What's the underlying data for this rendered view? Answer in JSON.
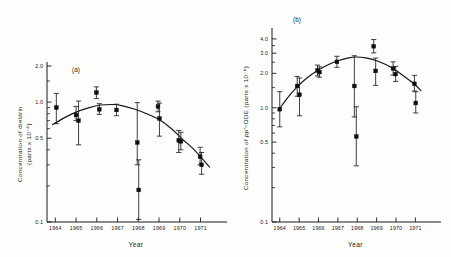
{
  "figure": {
    "background": "#fdfdfb",
    "ink": "#141414",
    "panels": [
      "a",
      "b"
    ]
  },
  "chart_data": [
    {
      "type": "scatter",
      "panel_label": "(a)",
      "title": "",
      "xlabel": "Year",
      "ylabel": "Concentration of dieldrin (parts x 10⁻⁶)",
      "ylabel_line1": "Concentration of dieldrin",
      "ylabel_line2": "(parts x 10⁻⁶)",
      "yscale": "log",
      "ylim": [
        0.1,
        2.0
      ],
      "ytick_labels": [
        "2.0",
        "1.0",
        "0.5",
        "0.1"
      ],
      "ytick_values": [
        2.0,
        1.0,
        0.5,
        0.1
      ],
      "yminor_values": [
        1.5,
        0.9,
        0.8,
        0.7,
        0.6,
        0.4,
        0.3,
        0.2
      ],
      "xlim": [
        1963.6,
        1971.6
      ],
      "xtick_labels": [
        "1964",
        "1965",
        "1966",
        "1967",
        "1968",
        "1969",
        "1970",
        "1971"
      ],
      "xtick_values": [
        1964,
        1965,
        1966,
        1967,
        1968,
        1969,
        1970,
        1971
      ],
      "grid": false,
      "legend": null,
      "marker": "filled-square",
      "points": [
        {
          "x": 1964.05,
          "y": 0.9,
          "ylo": 0.66,
          "yhi": 1.18
        },
        {
          "x": 1965.0,
          "y": 0.78,
          "ylo": 0.7,
          "yhi": 0.92
        },
        {
          "x": 1965.12,
          "y": 0.7,
          "ylo": 0.44,
          "yhi": 1.02
        },
        {
          "x": 1965.98,
          "y": 1.2,
          "ylo": 1.07,
          "yhi": 1.34
        },
        {
          "x": 1966.12,
          "y": 0.87,
          "ylo": 0.79,
          "yhi": 0.97
        },
        {
          "x": 1966.95,
          "y": 0.86,
          "ylo": 0.77,
          "yhi": 0.96
        },
        {
          "x": 1967.95,
          "y": 0.46,
          "ylo": 0.3,
          "yhi": 0.99
        },
        {
          "x": 1968.02,
          "y": 0.185,
          "ylo": 0.105,
          "yhi": 0.33
        },
        {
          "x": 1968.95,
          "y": 0.92,
          "ylo": 0.83,
          "yhi": 1.02
        },
        {
          "x": 1969.02,
          "y": 0.73,
          "ylo": 0.52,
          "yhi": 0.98
        },
        {
          "x": 1969.95,
          "y": 0.48,
          "ylo": 0.38,
          "yhi": 0.58
        },
        {
          "x": 1970.05,
          "y": 0.47,
          "ylo": 0.4,
          "yhi": 0.56
        },
        {
          "x": 1970.98,
          "y": 0.35,
          "ylo": 0.3,
          "yhi": 0.42
        },
        {
          "x": 1971.05,
          "y": 0.3,
          "ylo": 0.25,
          "yhi": 0.38
        }
      ],
      "fit_curve": [
        {
          "x": 1963.85,
          "y": 0.645
        },
        {
          "x": 1964.4,
          "y": 0.735
        },
        {
          "x": 1965.0,
          "y": 0.825
        },
        {
          "x": 1965.6,
          "y": 0.895
        },
        {
          "x": 1966.2,
          "y": 0.945
        },
        {
          "x": 1966.8,
          "y": 0.955
        },
        {
          "x": 1967.2,
          "y": 0.935
        },
        {
          "x": 1967.8,
          "y": 0.875
        },
        {
          "x": 1968.4,
          "y": 0.8
        },
        {
          "x": 1969.0,
          "y": 0.715
        },
        {
          "x": 1969.6,
          "y": 0.6
        },
        {
          "x": 1970.1,
          "y": 0.495
        },
        {
          "x": 1970.6,
          "y": 0.415
        },
        {
          "x": 1971.1,
          "y": 0.335
        },
        {
          "x": 1971.45,
          "y": 0.285
        }
      ]
    },
    {
      "type": "scatter",
      "panel_label": "(b)",
      "title": "",
      "xlabel": "Year",
      "ylabel": "Concentration of pp'-DDE (parts x 10⁻⁶)",
      "ylabel_pre": "Concentration of ",
      "ylabel_italic": "pp'",
      "ylabel_post": "−DDE (parts x 10⁻⁶)",
      "yscale": "log",
      "ylim": [
        0.1,
        4.6
      ],
      "ytick_labels": [
        "4.0",
        "3.0",
        "2.0",
        "1.0",
        "0.5",
        "0.1"
      ],
      "ytick_values": [
        4.0,
        3.0,
        2.0,
        1.0,
        0.5,
        0.1
      ],
      "yminor_values": [
        3.5,
        2.5,
        1.5,
        0.9,
        0.8,
        0.7,
        0.6,
        0.4,
        0.3,
        0.2
      ],
      "xlim": [
        1963.6,
        1971.6
      ],
      "xtick_labels": [
        "1964",
        "1965",
        "1966",
        "1967",
        "1968",
        "1969",
        "1970",
        "1971"
      ],
      "xtick_values": [
        1964,
        1965,
        1966,
        1967,
        1968,
        1969,
        1970,
        1971
      ],
      "grid": false,
      "legend": null,
      "marker": "filled-square",
      "points": [
        {
          "x": 1964.0,
          "y": 0.97,
          "ylo": 0.68,
          "yhi": 1.38
        },
        {
          "x": 1964.9,
          "y": 1.55,
          "ylo": 1.26,
          "yhi": 1.88
        },
        {
          "x": 1965.02,
          "y": 1.3,
          "ylo": 0.85,
          "yhi": 1.82
        },
        {
          "x": 1965.95,
          "y": 2.12,
          "ylo": 1.9,
          "yhi": 2.36
        },
        {
          "x": 1966.05,
          "y": 2.05,
          "ylo": 1.85,
          "yhi": 2.28
        },
        {
          "x": 1966.95,
          "y": 2.52,
          "ylo": 2.26,
          "yhi": 2.82
        },
        {
          "x": 1967.85,
          "y": 1.55,
          "ylo": 0.83,
          "yhi": 2.85
        },
        {
          "x": 1967.95,
          "y": 0.56,
          "ylo": 0.31,
          "yhi": 1.02
        },
        {
          "x": 1968.85,
          "y": 3.45,
          "ylo": 3.02,
          "yhi": 3.95
        },
        {
          "x": 1968.95,
          "y": 2.1,
          "ylo": 1.57,
          "yhi": 2.72
        },
        {
          "x": 1969.85,
          "y": 2.2,
          "ylo": 1.93,
          "yhi": 2.52
        },
        {
          "x": 1969.98,
          "y": 1.97,
          "ylo": 1.7,
          "yhi": 2.3
        },
        {
          "x": 1970.95,
          "y": 1.62,
          "ylo": 1.4,
          "yhi": 1.92
        },
        {
          "x": 1971.02,
          "y": 1.1,
          "ylo": 0.9,
          "yhi": 1.38
        }
      ],
      "fit_curve": [
        {
          "x": 1963.95,
          "y": 0.96
        },
        {
          "x": 1964.4,
          "y": 1.22
        },
        {
          "x": 1964.9,
          "y": 1.52
        },
        {
          "x": 1965.4,
          "y": 1.82
        },
        {
          "x": 1965.95,
          "y": 2.12
        },
        {
          "x": 1966.5,
          "y": 2.38
        },
        {
          "x": 1967.0,
          "y": 2.58
        },
        {
          "x": 1967.5,
          "y": 2.72
        },
        {
          "x": 1967.95,
          "y": 2.78
        },
        {
          "x": 1968.5,
          "y": 2.72
        },
        {
          "x": 1969.0,
          "y": 2.58
        },
        {
          "x": 1969.5,
          "y": 2.38
        },
        {
          "x": 1970.0,
          "y": 2.12
        },
        {
          "x": 1970.5,
          "y": 1.84
        },
        {
          "x": 1971.0,
          "y": 1.58
        },
        {
          "x": 1971.3,
          "y": 1.4
        }
      ]
    }
  ]
}
